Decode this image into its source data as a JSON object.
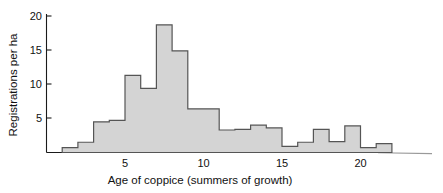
{
  "chart_data": {
    "type": "bar",
    "title": "",
    "subtitle": "",
    "xlabel": "Age of coppice (summers of growth)",
    "ylabel": "Registrations per ha",
    "xlim": [
      0,
      23
    ],
    "ylim": [
      0,
      20.6
    ],
    "grid": false,
    "legend": "none",
    "bin_width": 1,
    "categories": [
      1,
      2,
      3,
      4,
      5,
      6,
      7,
      8,
      9,
      10,
      11,
      12,
      13,
      14,
      15,
      16,
      17,
      18,
      19,
      20,
      21
    ],
    "values": [
      0.7,
      1.5,
      4.5,
      4.7,
      11.3,
      9.4,
      18.7,
      14.9,
      6.4,
      6.4,
      3.3,
      3.4,
      4.0,
      3.6,
      0.9,
      1.5,
      3.4,
      1.6,
      3.9,
      0.7,
      1.3
    ],
    "xticks": [
      5,
      10,
      15,
      20
    ],
    "xtick_labels": [
      "5",
      "10",
      "15",
      "20"
    ],
    "yticks": [
      5,
      10,
      15,
      20
    ],
    "ytick_labels": [
      "5",
      "10",
      "15",
      "20"
    ],
    "bar_fill_color": "#d4d4d4",
    "bar_edge_color": "#555555",
    "axis_color": "#1a1a1a",
    "background_color": "#ffffff"
  }
}
